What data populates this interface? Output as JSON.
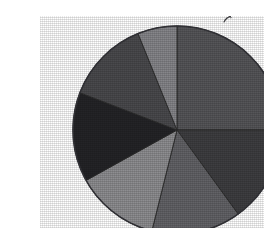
{
  "figure": {
    "background_color": "#ffffff",
    "artifact_name": "scanned-pie-chart",
    "has_title": false,
    "has_legend": false,
    "has_labels": false,
    "stray_mark_label": "scan-artifact"
  },
  "chart_data": {
    "type": "pie",
    "title": "",
    "subtitle": "",
    "xlabel": "",
    "ylabel": "",
    "grid": false,
    "legend_position": "none",
    "center_x": 137,
    "center_y": 114,
    "radius": 104,
    "start_angle_deg": -90,
    "direction": "clockwise",
    "total": 100,
    "slice_border_color": "#2a2a2a",
    "outline_color": "#35353a",
    "categories": [
      "Slice 1",
      "Slice 2",
      "Slice 3",
      "Slice 4",
      "Slice 5",
      "Slice 6",
      "Slice 7"
    ],
    "values": [
      25,
      15,
      14,
      13,
      14,
      13,
      6
    ],
    "percentages": [
      "25%",
      "15%",
      "14%",
      "13%",
      "14%",
      "13%",
      "6%"
    ],
    "angles_deg": [
      90,
      54,
      50,
      47,
      50,
      47,
      22
    ],
    "colors": [
      "#565659",
      "#3e3e41",
      "#636367",
      "#8e8e91",
      "#242427",
      "#4a4a4d",
      "#86868a"
    ],
    "slices": [
      {
        "label": "Slice 1",
        "value": 25,
        "percent": "25%",
        "color": "#565659",
        "start_deg": -90,
        "end_deg": 0,
        "tone": "medium-dark-gray"
      },
      {
        "label": "Slice 2",
        "value": 15,
        "percent": "15%",
        "color": "#3e3e41",
        "start_deg": 0,
        "end_deg": 54,
        "tone": "dark-gray"
      },
      {
        "label": "Slice 3",
        "value": 14,
        "percent": "14%",
        "color": "#636367",
        "start_deg": 54,
        "end_deg": 104,
        "tone": "medium-gray"
      },
      {
        "label": "Slice 4",
        "value": 13,
        "percent": "13%",
        "color": "#8e8e91",
        "start_deg": 104,
        "end_deg": 151,
        "tone": "light-gray"
      },
      {
        "label": "Slice 5",
        "value": 14,
        "percent": "14%",
        "color": "#242427",
        "start_deg": 151,
        "end_deg": 201,
        "tone": "near-black"
      },
      {
        "label": "Slice 6",
        "value": 13,
        "percent": "13%",
        "color": "#4a4a4d",
        "start_deg": 201,
        "end_deg": 248,
        "tone": "dark-medium-gray"
      },
      {
        "label": "Slice 7",
        "value": 6,
        "percent": "6%",
        "color": "#86868a",
        "start_deg": 248,
        "end_deg": 270,
        "tone": "light-gray"
      }
    ]
  }
}
